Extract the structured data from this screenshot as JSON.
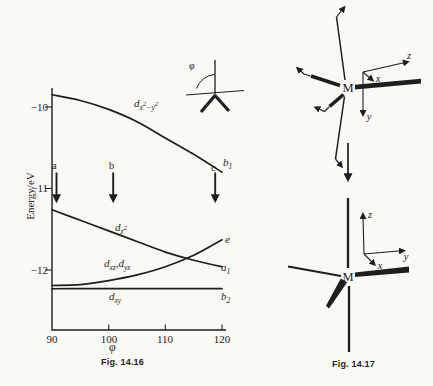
{
  "page": {
    "paper": "#faf9f6",
    "ink": "#1e1e1e"
  },
  "left_figure": {
    "caption": "Fig. 14.16",
    "y_axis_label": "Energy/eV",
    "x_axis_label": "φ",
    "y_ticks": [
      "−10",
      "−11",
      "−12"
    ],
    "x_ticks": [
      "90",
      "100",
      "110",
      "120"
    ],
    "inset_angle_label": "φ",
    "scan_arrow_labels": {
      "a": "a",
      "b": "b",
      "c": "c"
    },
    "curve_labels": {
      "dx2y2": "d_{x}^{2}_{−y}^{2}",
      "dz2": "d_{z}^{2}",
      "dxzyz": "d_{xz},d_{yz}",
      "dxy": "d_{xy}"
    },
    "symmetry_labels": {
      "b1": "b_{1}",
      "e": "e",
      "a1": "a_{1}",
      "b2": "b_{2}"
    }
  },
  "chart_data": {
    "type": "line",
    "xlabel": "φ",
    "ylabel": "Energy/eV",
    "xlim": [
      90,
      120
    ],
    "ylim": [
      -12.75,
      -9.75
    ],
    "grid": false,
    "legend_position": "none",
    "x": [
      90,
      95,
      100,
      105,
      110,
      115,
      120
    ],
    "series": [
      {
        "name": "d(x2−y2)",
        "symmetry": "b1",
        "values": [
          -9.85,
          -9.92,
          -10.03,
          -10.18,
          -10.38,
          -10.58,
          -10.8
        ]
      },
      {
        "name": "d(z2)",
        "symmetry": "a1",
        "values": [
          -11.26,
          -11.39,
          -11.52,
          -11.65,
          -11.78,
          -11.88,
          -11.96
        ]
      },
      {
        "name": "d(xz), d(yz)",
        "symmetry": "e",
        "values": [
          -12.19,
          -12.18,
          -12.13,
          -12.06,
          -11.96,
          -11.82,
          -11.63
        ]
      },
      {
        "name": "d(xy)",
        "symmetry": "b2",
        "values": [
          -12.23,
          -12.23,
          -12.23,
          -12.23,
          -12.23,
          -12.23,
          -12.23
        ]
      }
    ],
    "phi_marker_arrows": [
      {
        "label": "a",
        "phi": 90.8
      },
      {
        "label": "b",
        "phi": 100.8
      },
      {
        "label": "c",
        "phi": 118.8
      }
    ]
  },
  "right_figure": {
    "caption": "Fig. 14.17",
    "top_structure": {
      "metal": "M",
      "axes": {
        "x": "x",
        "y": "y",
        "z": "z"
      }
    },
    "bottom_structure": {
      "metal": "M",
      "axes": {
        "x": "x",
        "y": "y",
        "z": "z"
      }
    }
  }
}
